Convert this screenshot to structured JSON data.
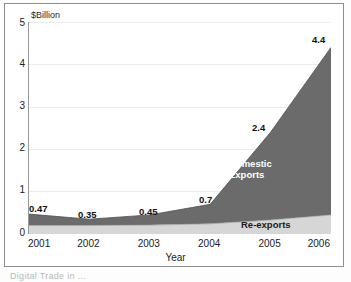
{
  "figure": {
    "caption": "Digital Trade in ...",
    "ylabel": "$Billion",
    "xlabel": "Year"
  },
  "chart_data": {
    "type": "area",
    "stacked": true,
    "title": "",
    "xlabel": "Year",
    "ylabel": "$Billion",
    "x": [
      2001,
      2002,
      2003,
      2004,
      2005,
      2006
    ],
    "categories": [
      "2001",
      "2002",
      "2003",
      "2004",
      "2005",
      "2006"
    ],
    "xlim": [
      2001,
      2006
    ],
    "ylim": [
      0,
      5
    ],
    "yticks": [
      0,
      1,
      2,
      3,
      4,
      5
    ],
    "ytick_labels": [
      "0",
      "1",
      "2",
      "3",
      "4",
      "5"
    ],
    "grid": "horizontal",
    "legend": "inline-annotations",
    "series": [
      {
        "name": "Re-exports",
        "color": "#d6d6d6",
        "values": [
          0.2,
          0.2,
          0.21,
          0.24,
          0.33,
          0.45
        ]
      },
      {
        "name": "Domestic Exports",
        "color": "#6b6b6b",
        "values": [
          0.27,
          0.15,
          0.24,
          0.46,
          2.07,
          3.95
        ]
      }
    ],
    "totals": [
      0.47,
      0.35,
      0.45,
      0.7,
      2.4,
      4.4
    ],
    "data_labels": [
      "0.47",
      "0.35",
      "0.45",
      "0.7",
      "2.4",
      "4.4"
    ],
    "annotations": [
      {
        "text": "Domestic Exports",
        "series": "Domestic Exports"
      },
      {
        "text": "Re-exports",
        "series": "Re-exports"
      }
    ]
  },
  "labels": {
    "v0": "0.47",
    "v1": "0.35",
    "v2": "0.45",
    "v3": "0.7",
    "v4": "2.4",
    "v5": "4.4",
    "domestic_line1": "Domestic",
    "domestic_line2": "Exports",
    "reexports": "Re-exports"
  },
  "yticks": {
    "t0": "0",
    "t1": "1",
    "t2": "2",
    "t3": "3",
    "t4": "4",
    "t5": "5"
  },
  "xticks": {
    "t0": "2001",
    "t1": "2002",
    "t2": "2003",
    "t3": "2004",
    "t4": "2005",
    "t5": "2006"
  }
}
